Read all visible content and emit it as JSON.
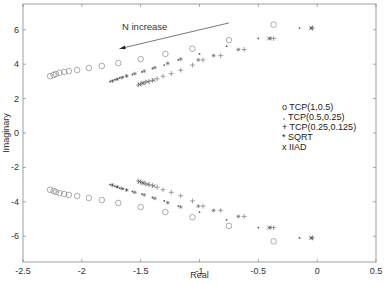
{
  "chart_data": {
    "type": "scatter",
    "title": "",
    "xlabel": "Real",
    "ylabel": "Imaginary",
    "xlim": [
      -2.5,
      0.5
    ],
    "ylim": [
      -7.5,
      7.5
    ],
    "xticks": [
      -2.5,
      -2,
      -1.5,
      -1,
      -0.5,
      0,
      0.5
    ],
    "xtick_labels": [
      "-2.5",
      "-2",
      "-1.5",
      "-1",
      "-0.5",
      "0",
      "0.5"
    ],
    "yticks": [
      -6,
      -4,
      -2,
      0,
      2,
      4,
      6
    ],
    "ytick_labels": [
      "-6",
      "-4",
      "-2",
      "0",
      "2",
      "4",
      "6"
    ],
    "grid": false,
    "legend_position": "center-right",
    "annotations": [
      {
        "text": "N increase",
        "x": -1.4,
        "y": 6.3,
        "arrow_from": [
          -0.75,
          6.4
        ],
        "arrow_to": [
          -1.68,
          4.9
        ]
      }
    ],
    "symmetric_about_real_axis": true,
    "series": [
      {
        "name": "TCP(1,0.5)",
        "marker": "o",
        "x": [
          -2.27,
          -2.24,
          -2.22,
          -2.19,
          -2.15,
          -2.11,
          -2.04,
          -1.94,
          -1.83,
          -1.69,
          -1.5,
          -1.29,
          -1.06,
          -0.75,
          -0.37
        ],
        "y": [
          3.3,
          3.37,
          3.43,
          3.5,
          3.55,
          3.6,
          3.66,
          3.78,
          3.9,
          4.07,
          4.3,
          4.6,
          4.9,
          5.4,
          6.3
        ]
      },
      {
        "name": "TCP(0.5,0.25)",
        "marker": ".",
        "x": [
          -1.76,
          -1.74,
          -1.72,
          -1.7,
          -1.68,
          -1.65,
          -1.62,
          -1.57,
          -1.49,
          -1.4,
          -1.3,
          -1.18,
          -1.0,
          -0.77,
          -0.5,
          -0.15
        ],
        "y": [
          3.0,
          3.05,
          3.1,
          3.15,
          3.2,
          3.25,
          3.3,
          3.4,
          3.55,
          3.75,
          3.95,
          4.25,
          4.6,
          5.05,
          5.5,
          6.1
        ]
      },
      {
        "name": "TCP(0.25,0.125)",
        "marker": "+",
        "x": [
          -1.52,
          -1.5,
          -1.48,
          -1.46,
          -1.43,
          -1.4,
          -1.36,
          -1.31,
          -1.24,
          -1.16,
          -1.06,
          -0.97,
          -0.82,
          -0.62,
          -0.37,
          -0.04
        ],
        "y": [
          2.8,
          2.85,
          2.9,
          2.95,
          3.0,
          3.05,
          3.15,
          3.3,
          3.45,
          3.65,
          3.95,
          4.25,
          4.5,
          4.85,
          5.5,
          6.1
        ]
      },
      {
        "name": "SQRT",
        "marker": "*",
        "x": [
          -1.74,
          -1.7,
          -1.66,
          -1.62,
          -1.55,
          -1.47,
          -1.38,
          -1.27,
          -1.16,
          -1.01,
          -0.88,
          -0.67,
          -0.4,
          -0.05
        ],
        "y": [
          3.02,
          3.12,
          3.22,
          3.32,
          3.45,
          3.6,
          3.8,
          4.05,
          4.3,
          4.25,
          4.5,
          4.85,
          5.5,
          6.1
        ]
      },
      {
        "name": "IIAD",
        "marker": "x",
        "x": [
          -1.51,
          -1.48,
          -1.44,
          -1.39,
          -0.41,
          -0.05
        ],
        "y": [
          2.82,
          2.9,
          2.98,
          3.08,
          5.5,
          6.1
        ]
      }
    ]
  },
  "legend": {
    "items": [
      {
        "symbol": "o",
        "label": "TCP(1,0.5)"
      },
      {
        "symbol": ".",
        "label": "TCP(0.5,0.25)"
      },
      {
        "symbol": "+",
        "label": "TCP(0.25,0.125)"
      },
      {
        "symbol": "*",
        "label": "SQRT"
      },
      {
        "symbol": "x",
        "label": "IIAD"
      }
    ]
  },
  "annotation_text": "N increase",
  "axes": {
    "xlabel": "Real",
    "ylabel": "Imaginary"
  },
  "colors": {
    "marker": "#555555",
    "axis": "#888888",
    "text": "#333333"
  }
}
